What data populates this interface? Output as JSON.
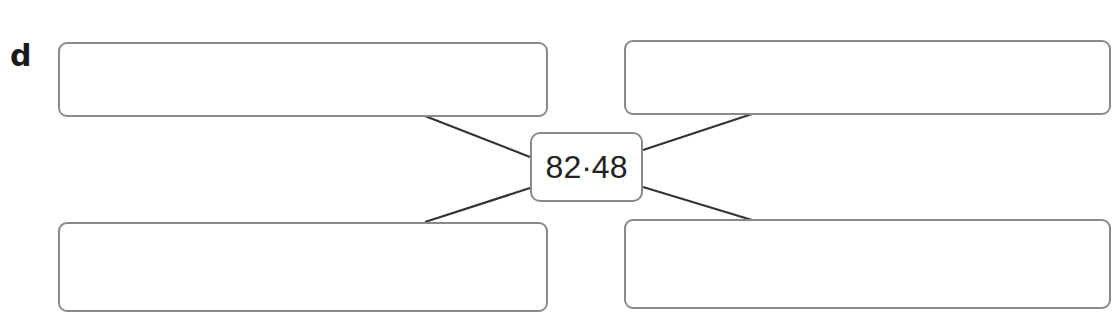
{
  "question": {
    "label": "d",
    "center_value": "82·48"
  },
  "answer_boxes": [
    {
      "position": "top-left",
      "value": ""
    },
    {
      "position": "top-right",
      "value": ""
    },
    {
      "position": "bottom-left",
      "value": ""
    },
    {
      "position": "bottom-right",
      "value": ""
    }
  ],
  "colors": {
    "border": "#8a8a8a",
    "connector": "#333333",
    "text": "#222222"
  }
}
